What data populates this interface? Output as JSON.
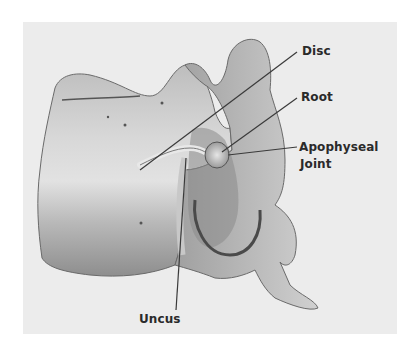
{
  "figure": {
    "colors": {
      "background": "#ececec",
      "bone_light": "#d6d6d6",
      "bone_mid": "#a8a8a8",
      "bone_dark": "#5a5a5a",
      "leader_line": "#3a3a3a",
      "label_text": "#2a2a2a"
    },
    "labels": {
      "disc": "Disc",
      "root": "Root",
      "apophyseal_line1": "Apophyseal",
      "apophyseal_line2": "Joint",
      "uncus": "Uncus"
    }
  }
}
